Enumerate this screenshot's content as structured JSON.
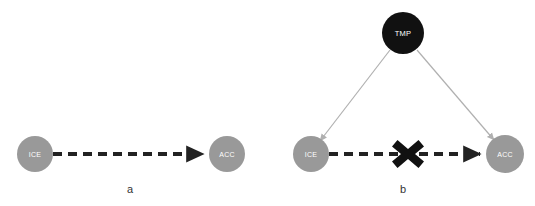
{
  "figure": {
    "background_color": "#ffffff",
    "panels": [
      {
        "id": "panel-a",
        "caption": "a",
        "caption_x": 130,
        "caption_y": 193,
        "nodes": [
          {
            "id": "ice-a",
            "label": "ICE",
            "cx": 35,
            "cy": 154,
            "r": 18,
            "fill": "#999999",
            "text_color": "#ffffff"
          },
          {
            "id": "acc-a",
            "label": "ACC",
            "cx": 227,
            "cy": 154,
            "r": 18,
            "fill": "#999999",
            "text_color": "#ffffff"
          }
        ],
        "edges": [
          {
            "id": "ice-to-acc-a",
            "from": "ice-a",
            "to": "acc-a",
            "style": "dashed",
            "color": "#222222",
            "width": 4,
            "dash": "9,6",
            "arrowhead": true,
            "blocked": false
          }
        ]
      },
      {
        "id": "panel-b",
        "caption": "b",
        "caption_x": 403,
        "caption_y": 193,
        "nodes": [
          {
            "id": "tmp-b",
            "label": "TMP",
            "cx": 403,
            "cy": 33,
            "r": 21,
            "fill": "#111111",
            "text_color": "#ffffff"
          },
          {
            "id": "ice-b",
            "label": "ICE",
            "cx": 311,
            "cy": 154,
            "r": 18,
            "fill": "#999999",
            "text_color": "#ffffff"
          },
          {
            "id": "acc-b",
            "label": "ACC",
            "cx": 505,
            "cy": 154,
            "r": 19,
            "fill": "#999999",
            "text_color": "#ffffff"
          }
        ],
        "edges": [
          {
            "id": "tmp-to-ice-b",
            "from": "tmp-b",
            "to": "ice-b",
            "style": "solid",
            "color": "#b0b0b0",
            "width": 1.2,
            "arrowhead": true,
            "blocked": false
          },
          {
            "id": "tmp-to-acc-b",
            "from": "tmp-b",
            "to": "acc-b",
            "style": "solid",
            "color": "#b0b0b0",
            "width": 1.2,
            "arrowhead": true,
            "blocked": false
          },
          {
            "id": "ice-to-acc-b",
            "from": "ice-b",
            "to": "acc-b",
            "style": "dashed",
            "color": "#222222",
            "width": 4,
            "dash": "9,6",
            "arrowhead": true,
            "blocked": true
          }
        ],
        "blocker": {
          "id": "cross-marker",
          "symbol": "X",
          "cx": 408,
          "cy": 154,
          "size": 30,
          "color": "#111111"
        }
      }
    ]
  }
}
